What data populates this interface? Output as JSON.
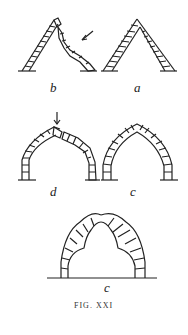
{
  "figure": {
    "caption": "FIG. XXI",
    "panels": [
      {
        "id": "b",
        "label": "b",
        "description": "pointed arch with collapsing right side, arrow indicating force"
      },
      {
        "id": "a",
        "label": "a",
        "description": "stable pointed arch of two straight voussoir legs"
      },
      {
        "id": "d",
        "label": "d",
        "description": "curved pointed arch with downward load arrow at crown, displaced voussoirs"
      },
      {
        "id": "c1",
        "label": "c",
        "description": "stable curved pointed arch"
      },
      {
        "id": "c2",
        "label": "c",
        "description": "cusped pointed arch (trefoil intrados) with radial joints"
      }
    ]
  },
  "colors": {
    "ink": "#222222",
    "background": "#ffffff"
  }
}
